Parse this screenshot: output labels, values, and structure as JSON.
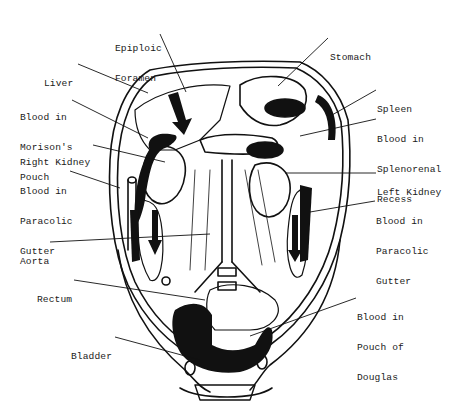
{
  "diagram": {
    "type": "anatomical-illustration",
    "colors": {
      "ink": "#111111",
      "background": "#ffffff",
      "label": "#1a1a1a"
    },
    "labels": {
      "epiploic_foramen": [
        "Epiploic",
        "Foramen"
      ],
      "stomach": [
        "Stomach"
      ],
      "liver": [
        "Liver"
      ],
      "morison": [
        "Blood in",
        "Morison's",
        "Pouch"
      ],
      "spleen": [
        "Spleen"
      ],
      "splenorenal": [
        "Blood in",
        "Splenorenal",
        "Recess"
      ],
      "right_kidney": [
        "Right Kidney"
      ],
      "left_kidney": [
        "Left Kidney"
      ],
      "paracolic_right": [
        "Blood in",
        "Paracolic",
        "Gutter"
      ],
      "paracolic_left": [
        "Blood in",
        "Paracolic",
        "Gutter"
      ],
      "aorta": [
        "Aorta"
      ],
      "rectum": [
        "Rectum"
      ],
      "pouch_douglas": [
        "Blood in",
        "Pouch of",
        "Douglas"
      ],
      "bladder": [
        "Bladder"
      ]
    }
  }
}
